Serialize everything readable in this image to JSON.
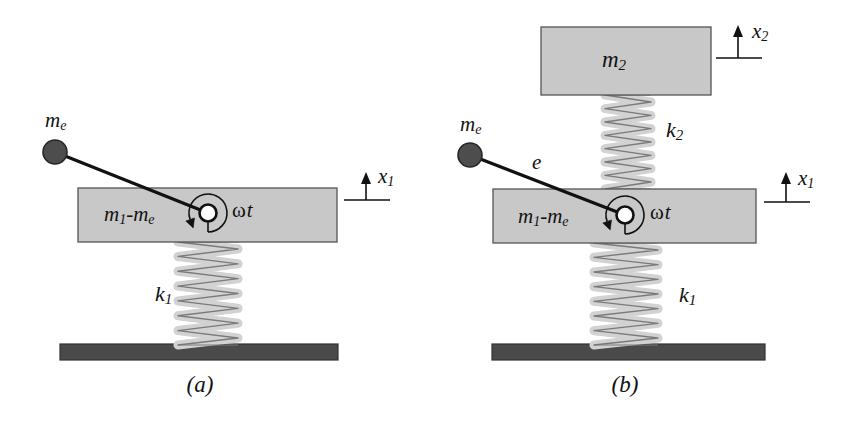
{
  "figure": {
    "kind": "mechanical-vibration-schematic",
    "panels": [
      {
        "id": "a",
        "caption": "(a)",
        "caption_x": 200,
        "caption_y": 392,
        "eccentric_mass_label": "me",
        "eccentric_mass_label_base": "m",
        "eccentric_mass_label_sub": "e",
        "eccentric_mass_label_x": 45,
        "eccentric_mass_label_y": 122,
        "ball": {
          "cx": 55,
          "cy": 152,
          "r": 12
        },
        "arm": {
          "x1": 55,
          "y1": 152,
          "x2": 208,
          "y2": 213
        },
        "arm_length_label": "",
        "block": {
          "x": 78,
          "y": 188,
          "w": 259,
          "h": 54,
          "label_base": "m",
          "label_sub1": "1",
          "label_mid": "-",
          "label_base2": "m",
          "label_sub2": "e",
          "label_full": "m1-me",
          "label_x": 104,
          "label_y": 216
        },
        "hub": {
          "cx": 208,
          "cy": 213,
          "r_outer": 8.5,
          "r_inner": 4.2
        },
        "angle_label": "ωt",
        "angle_label_x": 232,
        "angle_label_y": 212,
        "spring": {
          "label_base": "k",
          "label_sub": "1",
          "label_full": "k1",
          "label_x": 155,
          "label_y": 296,
          "x_left": 178,
          "x_right": 238,
          "y_top": 242,
          "y_bottom": 345,
          "coils": 6
        },
        "ground": {
          "x": 60,
          "y": 344,
          "w": 278,
          "h": 16
        },
        "motion_arrows": [
          {
            "label_base": "x",
            "label_sub": "1",
            "label_full": "x1",
            "label_x": 378,
            "label_y": 178,
            "arrow_x": 366,
            "arrow_tip_y": 172,
            "arrow_base_y": 200,
            "tick_x1": 344,
            "tick_x2": 390,
            "tick_y": 200
          }
        ]
      },
      {
        "id": "b",
        "caption": "(b)",
        "caption_x": 625,
        "caption_y": 392,
        "eccentric_mass_label": "me",
        "eccentric_mass_label_base": "m",
        "eccentric_mass_label_sub": "e",
        "eccentric_mass_label_x": 460,
        "eccentric_mass_label_y": 126,
        "ball": {
          "cx": 470,
          "cy": 155,
          "r": 12
        },
        "arm": {
          "x1": 470,
          "y1": 155,
          "x2": 625,
          "y2": 215
        },
        "arm_length_label": "e",
        "arm_length_label_x": 532,
        "arm_length_label_y": 164,
        "top_block": {
          "x": 541,
          "y": 27,
          "w": 170,
          "h": 68,
          "label_base": "m",
          "label_sub": "2",
          "label_full": "m2",
          "label_x": 614,
          "label_y": 62
        },
        "block": {
          "x": 493,
          "y": 189,
          "w": 263,
          "h": 54,
          "label_full": "m1-me",
          "label_x": 518,
          "label_y": 218
        },
        "hub": {
          "cx": 625,
          "cy": 215,
          "r_outer": 8.5,
          "r_inner": 4.2
        },
        "angle_label": "ωt",
        "angle_label_x": 650,
        "angle_label_y": 214,
        "upper_spring": {
          "label_base": "k",
          "label_sub": "2",
          "label_full": "k2",
          "label_x": 666,
          "label_y": 132,
          "x_left": 605,
          "x_right": 651,
          "y_top": 95,
          "y_bottom": 189,
          "coils": 6
        },
        "spring": {
          "label_base": "k",
          "label_sub": "1",
          "label_full": "k1",
          "label_x": 679,
          "label_y": 297,
          "x_left": 594,
          "x_right": 658,
          "y_top": 243,
          "y_bottom": 345,
          "coils": 6
        },
        "ground": {
          "x": 492,
          "y": 344,
          "w": 273,
          "h": 16
        },
        "motion_arrows": [
          {
            "label_base": "x",
            "label_sub": "2",
            "label_full": "x2",
            "label_x": 752,
            "label_y": 33,
            "arrow_x": 738,
            "arrow_tip_y": 25,
            "arrow_base_y": 58,
            "tick_x1": 716,
            "tick_x2": 762,
            "tick_y": 58
          },
          {
            "label_base": "x",
            "label_sub": "1",
            "label_full": "x1",
            "label_x": 798,
            "label_y": 180,
            "arrow_x": 786,
            "arrow_tip_y": 172,
            "arrow_base_y": 202,
            "tick_x1": 764,
            "tick_x2": 810,
            "tick_y": 202
          }
        ]
      }
    ]
  },
  "colors": {
    "background": "#ffffff",
    "block_fill": "#c8c8c8",
    "block_stroke": "#555555",
    "ball_fill": "#4d4d4d",
    "ball_stroke": "#262626",
    "ground_fill": "#4a4a4a",
    "ground_stroke": "#333333",
    "spring_fill": "#d2d2d2",
    "spring_stroke": "#7a7a7a",
    "line": "#111111",
    "text": "#111111",
    "hub_inner": "#ffffff"
  }
}
